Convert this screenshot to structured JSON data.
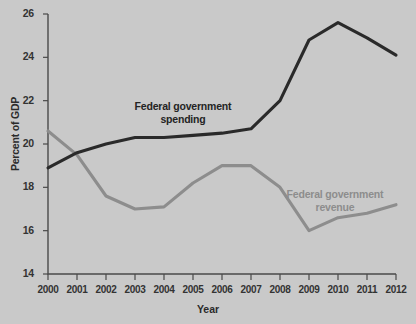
{
  "chart_data": {
    "type": "line",
    "title": "",
    "xlabel": "Year",
    "ylabel": "Percent of GDP",
    "xlim": [
      2000,
      2012
    ],
    "ylim": [
      14,
      26
    ],
    "ytick_step": 2,
    "grid": false,
    "legend_position": "inline-annotations",
    "x": [
      2000,
      2001,
      2002,
      2003,
      2004,
      2005,
      2006,
      2007,
      2008,
      2009,
      2010,
      2011,
      2012
    ],
    "xtick_labels": [
      "2000",
      "2001",
      "2002",
      "2003",
      "2004",
      "2005",
      "2006",
      "2007",
      "2008",
      "2009",
      "2010",
      "2011",
      "2012"
    ],
    "ytick_labels": [
      "26",
      "24",
      "22",
      "20",
      "18",
      "16",
      "14"
    ],
    "ytick_values": [
      26,
      24,
      22,
      20,
      18,
      16,
      14
    ],
    "series": [
      {
        "name": "Federal government spending",
        "color": "#2a2a2a",
        "values": [
          18.9,
          19.6,
          20.0,
          20.3,
          20.3,
          20.4,
          20.5,
          20.7,
          22.0,
          24.8,
          25.6,
          24.9,
          24.1
        ]
      },
      {
        "name": "Federal government revenue",
        "color": "#8d8d8d",
        "values": [
          20.6,
          19.5,
          17.6,
          17.0,
          17.1,
          18.2,
          19.0,
          19.0,
          18.0,
          16.0,
          16.6,
          16.8,
          17.2
        ]
      }
    ],
    "annotations": [
      {
        "id": "spending",
        "text": "Federal government\nspending",
        "line1": "Federal government",
        "line2": "spending"
      },
      {
        "id": "revenue",
        "text": "Federal government\nrevenue",
        "line1": "Federal government",
        "line2": "revenue"
      }
    ],
    "background_color": "#c9c9c9",
    "axis_color": "#4a4a4a"
  },
  "labels": {
    "y_axis_title": "Percent of GDP",
    "x_axis_title": "Year",
    "spending_line1": "Federal government",
    "spending_line2": "spending",
    "revenue_line1": "Federal government",
    "revenue_line2": "revenue"
  }
}
